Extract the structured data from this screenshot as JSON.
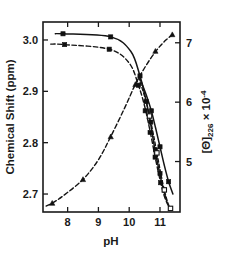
{
  "figure": {
    "name": "ph-titration-figure",
    "background_color": "#ffffff",
    "ink_color": "#1a1a1a"
  },
  "chart_data": {
    "type": "line",
    "title": "",
    "subtitle": "",
    "xlabel": "pH",
    "ylabel": "Chemical  Shift  (ppm)",
    "y2label": "[Θ]",
    "y2label_sub": "226",
    "y2label_times": "× 10",
    "y2label_exp": "-4",
    "xlim": [
      7.2,
      11.65
    ],
    "ylim": [
      2.665,
      3.035
    ],
    "y2lim": [
      4.15,
      7.35
    ],
    "xticks": [
      8,
      9,
      10,
      11
    ],
    "xtick_labels": [
      "8",
      "9",
      "10",
      "11"
    ],
    "yticks": [
      3.0,
      2.9,
      2.8,
      2.7
    ],
    "ytick_labels": [
      "3.0",
      "2.9",
      "2.8",
      "2.7"
    ],
    "y2ticks": [
      7,
      6,
      5
    ],
    "y2tick_labels": [
      "7",
      "6",
      "5"
    ],
    "grid": false,
    "legend": "none",
    "frame": "box",
    "tick_direction": "in",
    "series": [
      {
        "name": "chemical-shift-curve-1",
        "axis": "left",
        "style": "solid",
        "marker": "filled-square",
        "x": [
          7.6,
          7.85,
          9.4,
          10.05,
          10.35,
          10.5,
          10.62,
          10.72,
          10.82,
          10.95,
          11.08,
          11.22
        ],
        "y": [
          3.012,
          3.012,
          3.006,
          2.978,
          2.93,
          2.895,
          2.862,
          2.828,
          2.792,
          2.752,
          2.716,
          2.686
        ],
        "marker_x": [
          7.85,
          9.4,
          10.35,
          10.55,
          10.7,
          10.85,
          11.0
        ],
        "marker_y": [
          3.012,
          3.006,
          2.93,
          2.88,
          2.84,
          2.786,
          2.74
        ]
      },
      {
        "name": "chemical-shift-curve-2",
        "axis": "left",
        "style": "dashed",
        "marker": "filled-square",
        "x": [
          7.45,
          7.9,
          9.35,
          10.0,
          10.3,
          10.48,
          10.6,
          10.72,
          10.85,
          11.0,
          11.14,
          11.28
        ],
        "y": [
          2.992,
          2.991,
          2.982,
          2.955,
          2.912,
          2.876,
          2.845,
          2.81,
          2.77,
          2.728,
          2.696,
          2.676
        ],
        "marker_x": [
          7.9,
          9.35,
          10.3,
          10.52,
          10.68,
          10.84,
          11.02
        ],
        "marker_y": [
          2.991,
          2.982,
          2.912,
          2.862,
          2.82,
          2.772,
          2.722
        ]
      },
      {
        "name": "chemical-shift-curve-3",
        "axis": "left",
        "style": "dashed-fine",
        "marker": "open-square",
        "x": [
          10.3,
          10.52,
          10.66,
          10.78,
          10.9,
          11.02,
          11.14,
          11.26,
          11.36
        ],
        "y": [
          2.928,
          2.886,
          2.852,
          2.818,
          2.78,
          2.742,
          2.708,
          2.682,
          2.67
        ],
        "marker_x": [
          10.66,
          10.9,
          11.14,
          11.34
        ],
        "marker_y": [
          2.852,
          2.78,
          2.708,
          2.672
        ]
      },
      {
        "name": "chemical-shift-curve-4",
        "axis": "left",
        "style": "solid",
        "marker": "filled-square",
        "x": [
          10.34,
          10.56,
          10.72,
          10.86,
          11.0,
          11.14,
          11.28,
          11.42
        ],
        "y": [
          2.926,
          2.892,
          2.862,
          2.828,
          2.792,
          2.756,
          2.724,
          2.7
        ],
        "marker_x": [
          10.72,
          11.0,
          11.28
        ],
        "marker_y": [
          2.862,
          2.792,
          2.724
        ]
      },
      {
        "name": "ellipticity-226-curve",
        "axis": "right",
        "style": "dashed",
        "marker": "filled-triangle",
        "x": [
          7.3,
          7.5,
          7.85,
          8.5,
          9.0,
          9.4,
          9.85,
          10.2,
          10.55,
          10.9,
          11.2,
          11.45
        ],
        "y2": [
          4.25,
          4.3,
          4.42,
          4.7,
          5.03,
          5.42,
          5.9,
          6.3,
          6.62,
          6.88,
          7.05,
          7.15
        ],
        "marker_x": [
          7.5,
          8.5,
          9.4,
          10.2,
          10.85,
          11.4
        ],
        "marker_y2": [
          4.3,
          4.7,
          5.42,
          6.3,
          6.86,
          7.14
        ]
      }
    ]
  }
}
